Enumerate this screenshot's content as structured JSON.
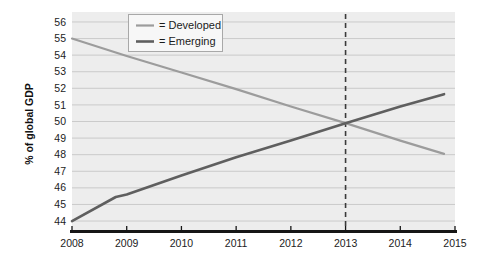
{
  "chart_data": {
    "type": "line",
    "title": "",
    "subtitle": "",
    "xlabel": "",
    "ylabel": "% of global GDP",
    "xlim": [
      2008,
      2015
    ],
    "ylim": [
      43.4,
      56.6
    ],
    "grid": true,
    "x_ticks": [
      "2008",
      "2009",
      "2010",
      "2011",
      "2012",
      "2013",
      "2014",
      "2015"
    ],
    "y_ticks": [
      "44",
      "45",
      "46",
      "47",
      "48",
      "49",
      "50",
      "51",
      "52",
      "53",
      "54",
      "55",
      "56"
    ],
    "legend_position": "top-center",
    "series": [
      {
        "name": "Developed",
        "legend_label": "= Developed",
        "color": "#9c9c9c",
        "x": [
          2008,
          2009,
          2010,
          2011,
          2012,
          2013,
          2014,
          2014.8
        ],
        "values": [
          55.0,
          53.95,
          52.95,
          51.95,
          50.9,
          49.9,
          48.85,
          48.05
        ]
      },
      {
        "name": "Emerging",
        "legend_label": "= Emerging",
        "color": "#5f5f5f",
        "x": [
          2008,
          2008.8,
          2009,
          2010,
          2011,
          2012,
          2013,
          2014,
          2014.8
        ],
        "values": [
          44.0,
          45.45,
          45.6,
          46.75,
          47.85,
          48.85,
          49.9,
          50.9,
          51.65
        ]
      }
    ],
    "annotations": [
      {
        "name": "forecast-divider",
        "type": "vertical-dashed-line",
        "x": 2013,
        "color": "#3b3b3b",
        "label": ""
      }
    ]
  }
}
